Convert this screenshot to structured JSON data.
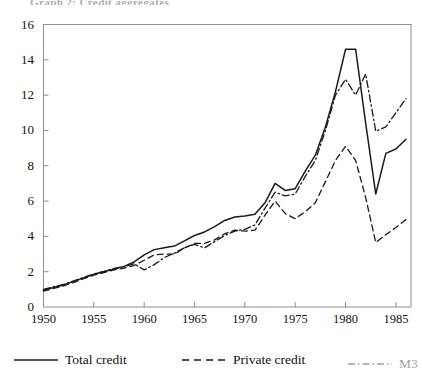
{
  "figure": {
    "title_clipped": "Graph 2: Credit aggregates",
    "background_color": "#ffffff",
    "line_color": "#1a1a1a"
  },
  "axes": {
    "y_ticks": [
      "0",
      "2",
      "4",
      "6",
      "8",
      "10",
      "12",
      "14",
      "16"
    ],
    "x_ticks": [
      "1950",
      "1955",
      "1960",
      "1965",
      "1970",
      "1975",
      "1980",
      "1985"
    ]
  },
  "legend": {
    "items": [
      {
        "label": "Total  credit",
        "style": "solid"
      },
      {
        "label": "Private credit",
        "style": "dashed"
      },
      {
        "label": "M3",
        "style": "dashdot"
      }
    ]
  },
  "chart_data": {
    "type": "line",
    "title": "Credit aggregates",
    "xlabel": "",
    "ylabel": "",
    "xlim": [
      1950,
      1986.5
    ],
    "ylim": [
      0,
      16
    ],
    "y_ticks": [
      0,
      2,
      4,
      6,
      8,
      10,
      12,
      14,
      16
    ],
    "x_ticks": [
      1950,
      1955,
      1960,
      1965,
      1970,
      1975,
      1980,
      1985
    ],
    "grid": false,
    "legend_position": "below-axes",
    "x": [
      1950,
      1951,
      1952,
      1953,
      1954,
      1955,
      1956,
      1957,
      1958,
      1959,
      1960,
      1961,
      1962,
      1963,
      1964,
      1965,
      1966,
      1967,
      1968,
      1969,
      1970,
      1971,
      1972,
      1973,
      1974,
      1975,
      1976,
      1977,
      1978,
      1979,
      1980,
      1981,
      1982,
      1983,
      1984,
      1985,
      1986
    ],
    "series": [
      {
        "name": "Total  credit",
        "style": "solid",
        "values": [
          0.95,
          1.1,
          1.25,
          1.45,
          1.65,
          1.85,
          2.0,
          2.15,
          2.3,
          2.55,
          2.95,
          3.25,
          3.35,
          3.45,
          3.75,
          4.05,
          4.25,
          4.55,
          4.9,
          5.1,
          5.15,
          5.25,
          5.9,
          7.0,
          6.6,
          6.7,
          7.7,
          8.6,
          10.2,
          12.2,
          14.6,
          14.6,
          10.4,
          6.4,
          8.7,
          8.95,
          9.5
        ]
      },
      {
        "name": "Private credit",
        "style": "dashed",
        "values": [
          0.9,
          1.05,
          1.2,
          1.4,
          1.6,
          1.8,
          1.95,
          2.1,
          2.2,
          2.35,
          2.65,
          2.95,
          3.0,
          3.0,
          3.35,
          3.6,
          3.6,
          3.8,
          4.15,
          4.35,
          4.3,
          4.35,
          5.2,
          6.0,
          5.3,
          5.0,
          5.4,
          5.9,
          7.1,
          8.3,
          9.1,
          8.3,
          6.2,
          3.65,
          4.1,
          4.5,
          4.95
        ]
      },
      {
        "name": "M3",
        "style": "dashdot",
        "values": [
          1.0,
          1.15,
          1.28,
          1.48,
          1.68,
          1.88,
          2.02,
          2.18,
          2.28,
          2.45,
          2.1,
          2.4,
          2.8,
          3.05,
          3.35,
          3.55,
          3.35,
          3.7,
          4.05,
          4.3,
          4.4,
          4.65,
          5.6,
          6.5,
          6.3,
          6.4,
          7.4,
          8.3,
          10.0,
          12.0,
          12.9,
          12.0,
          13.2,
          9.95,
          10.2,
          11.0,
          11.8
        ]
      }
    ]
  }
}
